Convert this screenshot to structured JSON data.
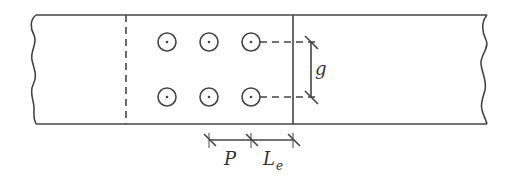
{
  "diagram": {
    "labels": {
      "pitch": "P",
      "gauge": "g",
      "end_distance_main": "L",
      "end_distance_sub": "e"
    },
    "bolts": {
      "rows": 2,
      "columns": 3
    },
    "colors": {
      "line": "#444444",
      "background": "#ffffff"
    }
  }
}
